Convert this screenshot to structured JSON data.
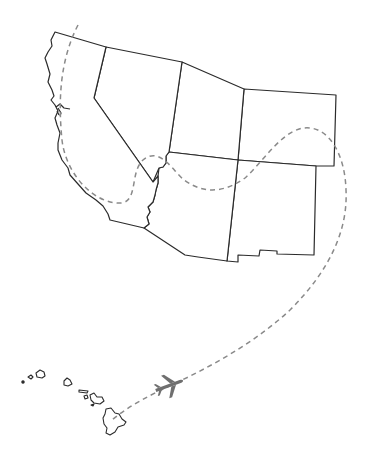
{
  "map": {
    "title": "Flight route from Hawaii across the US Southwest",
    "regions": [
      {
        "id": "california",
        "label": "California"
      },
      {
        "id": "nevada",
        "label": "Nevada"
      },
      {
        "id": "utah",
        "label": "Utah"
      },
      {
        "id": "colorado",
        "label": "Colorado"
      },
      {
        "id": "arizona",
        "label": "Arizona"
      },
      {
        "id": "new-mexico",
        "label": "New Mexico"
      },
      {
        "id": "hawaii",
        "label": "Hawaii"
      }
    ],
    "route": {
      "style": "dashed",
      "color": "#8a8a8a"
    },
    "plane_icon": {
      "name": "airplane-icon",
      "color": "#6f6f6f"
    },
    "stroke_color": "#2b2b2b",
    "background": "#ffffff"
  }
}
